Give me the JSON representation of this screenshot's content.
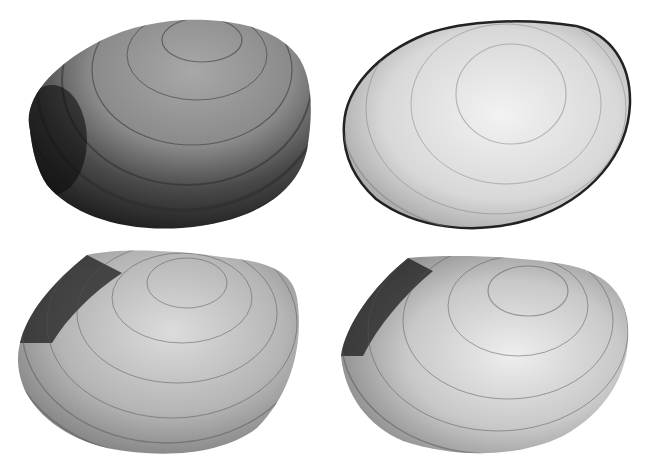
{
  "figure": {
    "background": "#ffffff",
    "panels": [
      {
        "position": "top-left",
        "view": "exterior",
        "tone": "dark",
        "x": 15,
        "y": 12,
        "w": 300,
        "h": 220
      },
      {
        "position": "top-right",
        "view": "exterior",
        "tone": "light",
        "x": 338,
        "y": 16,
        "w": 296,
        "h": 214
      },
      {
        "position": "bottom-left",
        "view": "exterior",
        "tone": "medium",
        "x": 15,
        "y": 245,
        "w": 290,
        "h": 212
      },
      {
        "position": "bottom-right",
        "view": "exterior",
        "tone": "medium-light",
        "x": 335,
        "y": 248,
        "w": 296,
        "h": 210
      }
    ]
  }
}
